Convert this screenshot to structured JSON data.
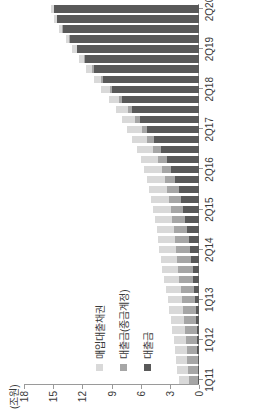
{
  "chart_data": {
    "type": "bar",
    "barmode": "stacked",
    "orientation": "vertical-rendered-rotated",
    "title": "",
    "subtitle": "",
    "unit_label": "(조원)",
    "xlabel": "",
    "ylabel": "",
    "ylim": [
      0,
      18
    ],
    "yticks": [
      0,
      3,
      6,
      9,
      12,
      15,
      18
    ],
    "ytick_labels": [
      "0",
      "3",
      "6",
      "9",
      "12",
      "15",
      "18"
    ],
    "grid": false,
    "legend_position": "inside-left",
    "categories": [
      "1Q11",
      "2Q11",
      "3Q11",
      "4Q11",
      "1Q12",
      "2Q12",
      "3Q12",
      "4Q12",
      "1Q13",
      "2Q13",
      "3Q13",
      "4Q13",
      "1Q14",
      "2Q14",
      "3Q14",
      "4Q14",
      "1Q15",
      "2Q15",
      "3Q15",
      "4Q15",
      "1Q16",
      "2Q16",
      "3Q16",
      "4Q16",
      "1Q17",
      "2Q17",
      "3Q17",
      "4Q17",
      "1Q18",
      "2Q18",
      "3Q18",
      "4Q18",
      "1Q19",
      "2Q19",
      "3Q19",
      "4Q19",
      "1Q20",
      "2Q20"
    ],
    "xtick_labels": [
      "1Q11",
      "1Q12",
      "1Q13",
      "2Q14",
      "2Q15",
      "2Q16",
      "2Q17",
      "2Q18",
      "2Q19",
      "2Q20"
    ],
    "xtick_categories": [
      "1Q11",
      "1Q12",
      "1Q13",
      "2Q14",
      "2Q15",
      "2Q16",
      "2Q17",
      "2Q18",
      "2Q19",
      "2Q20"
    ],
    "series": [
      {
        "name": "대출금",
        "color": "#595959",
        "values": [
          0.1,
          0.12,
          0.14,
          0.16,
          0.2,
          0.24,
          0.3,
          0.36,
          0.42,
          0.5,
          0.58,
          0.66,
          0.78,
          0.9,
          1.05,
          1.2,
          1.4,
          1.6,
          1.85,
          2.1,
          2.45,
          2.85,
          3.3,
          3.9,
          4.6,
          5.3,
          6.1,
          6.9,
          7.9,
          8.9,
          9.9,
          10.8,
          11.7,
          12.5,
          13.3,
          14.0,
          14.6,
          14.9
        ]
      },
      {
        "name": "대출금(종금계정)",
        "color": "#a6a6a6",
        "values": [
          0.95,
          1.0,
          1.05,
          1.1,
          1.15,
          1.2,
          1.25,
          1.3,
          1.35,
          1.4,
          1.45,
          1.5,
          1.5,
          1.5,
          1.45,
          1.4,
          1.35,
          1.3,
          1.25,
          1.2,
          1.1,
          1.0,
          0.9,
          0.8,
          0.7,
          0.6,
          0.5,
          0.4,
          0.32,
          0.25,
          0.2,
          0.16,
          0.12,
          0.1,
          0.08,
          0.06,
          0.05,
          0.04
        ]
      },
      {
        "name": "매입대출채권",
        "color": "#d9d9d9",
        "values": [
          1.05,
          1.1,
          1.15,
          1.2,
          1.25,
          1.3,
          1.35,
          1.4,
          1.45,
          1.5,
          1.55,
          1.6,
          1.65,
          1.7,
          1.72,
          1.75,
          1.78,
          1.8,
          1.82,
          1.85,
          1.85,
          1.8,
          1.75,
          1.7,
          1.6,
          1.5,
          1.35,
          1.2,
          1.05,
          0.9,
          0.75,
          0.62,
          0.5,
          0.42,
          0.35,
          0.3,
          0.3,
          0.28
        ]
      }
    ]
  },
  "legend": {
    "items": [
      {
        "label": "매입대출채권",
        "color": "#d9d9d9"
      },
      {
        "label": "대출금(종금계정)",
        "color": "#a6a6a6"
      },
      {
        "label": "대출금",
        "color": "#595959"
      }
    ]
  }
}
